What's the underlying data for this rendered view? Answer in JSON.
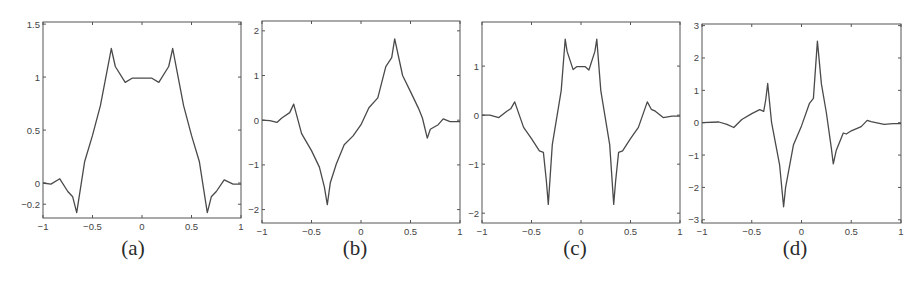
{
  "figure": {
    "line_color": "#4a4a4a",
    "axis_color": "#555555"
  },
  "chart_data": [
    {
      "type": "line",
      "caption": "(a)",
      "xlabel": "",
      "ylabel": "",
      "xlim": [
        -1,
        1
      ],
      "ylim": [
        -0.33,
        1.52
      ],
      "xticks": [
        -1,
        -0.5,
        0,
        0.5,
        1
      ],
      "xtick_labels": [
        "-1",
        "-0.5",
        "0",
        "0.5",
        "1"
      ],
      "yticks": [
        -0.2,
        0,
        0.5,
        1,
        1.5
      ],
      "ytick_labels": [
        "-0.2",
        "0",
        "0.5",
        "1",
        "1.5"
      ],
      "grid": false,
      "box": {
        "left": 43,
        "right": 241,
        "top": 22,
        "bottom": 218
      },
      "caption_pos": {
        "x": 133,
        "y": 236
      },
      "x": [
        -1,
        -0.92,
        -0.83,
        -0.75,
        -0.7,
        -0.66,
        -0.58,
        -0.5,
        -0.42,
        -0.34,
        -0.31,
        -0.27,
        -0.17,
        -0.1,
        0,
        0.1,
        0.17,
        0.27,
        0.31,
        0.34,
        0.42,
        0.5,
        0.58,
        0.66,
        0.7,
        0.75,
        0.83,
        0.92,
        1
      ],
      "y": [
        0,
        -0.01,
        0.04,
        -0.08,
        -0.13,
        -0.28,
        0.2,
        0.45,
        0.73,
        1.12,
        1.27,
        1.1,
        0.95,
        0.99,
        0.99,
        0.99,
        0.95,
        1.1,
        1.27,
        1.12,
        0.73,
        0.45,
        0.2,
        -0.28,
        -0.13,
        -0.08,
        0.03,
        -0.01,
        -0.01
      ]
    },
    {
      "type": "line",
      "caption": "(b)",
      "xlabel": "",
      "ylabel": "",
      "xlim": [
        -1,
        1
      ],
      "ylim": [
        -2.3,
        2.22
      ],
      "xticks": [
        -1,
        -0.5,
        0,
        0.5,
        1
      ],
      "xtick_labels": [
        "-1",
        "-0.5",
        "0",
        "0.5",
        "1"
      ],
      "yticks": [
        -2,
        -1,
        0,
        1,
        2
      ],
      "ytick_labels": [
        "-2",
        "-1",
        "0",
        "1",
        "2"
      ],
      "grid": false,
      "box": {
        "left": 262,
        "right": 460,
        "top": 21,
        "bottom": 223
      },
      "caption_pos": {
        "x": 355,
        "y": 236
      },
      "x": [
        -1,
        -0.92,
        -0.85,
        -0.8,
        -0.72,
        -0.68,
        -0.6,
        -0.5,
        -0.42,
        -0.37,
        -0.34,
        -0.31,
        -0.25,
        -0.17,
        -0.08,
        0,
        0.08,
        0.17,
        0.25,
        0.31,
        0.34,
        0.42,
        0.5,
        0.58,
        0.62,
        0.67,
        0.7,
        0.78,
        0.83,
        0.9,
        1
      ],
      "y": [
        0,
        -0.01,
        -0.05,
        0.05,
        0.17,
        0.36,
        -0.3,
        -0.68,
        -1.05,
        -1.5,
        -1.89,
        -1.4,
        -0.98,
        -0.55,
        -0.35,
        -0.1,
        0.28,
        0.5,
        1.2,
        1.4,
        1.82,
        1.0,
        0.64,
        0.27,
        0.05,
        -0.4,
        -0.2,
        -0.1,
        0.03,
        -0.03,
        -0.03
      ]
    },
    {
      "type": "line",
      "caption": "(c)",
      "xlabel": "",
      "ylabel": "",
      "xlim": [
        -1,
        1
      ],
      "ylim": [
        -2.2,
        1.9
      ],
      "xticks": [
        -1,
        -0.5,
        0,
        0.5,
        1
      ],
      "xtick_labels": [
        "-1",
        "-0.5",
        "0",
        "0.5",
        "1"
      ],
      "yticks": [
        -2,
        -1,
        0,
        1
      ],
      "ytick_labels": [
        "-2",
        "-1",
        "0",
        "1"
      ],
      "grid": false,
      "box": {
        "left": 482,
        "right": 680,
        "top": 22,
        "bottom": 223
      },
      "caption_pos": {
        "x": 575,
        "y": 236
      },
      "x": [
        -1,
        -0.92,
        -0.83,
        -0.75,
        -0.71,
        -0.67,
        -0.58,
        -0.5,
        -0.42,
        -0.38,
        -0.35,
        -0.33,
        -0.29,
        -0.2,
        -0.16,
        -0.14,
        -0.08,
        -0.04,
        0,
        0.04,
        0.08,
        0.14,
        0.16,
        0.2,
        0.29,
        0.33,
        0.35,
        0.38,
        0.42,
        0.5,
        0.58,
        0.67,
        0.71,
        0.75,
        0.83,
        0.92,
        1
      ],
      "y": [
        0,
        0,
        -0.05,
        0.08,
        0.13,
        0.27,
        -0.25,
        -0.48,
        -0.73,
        -0.76,
        -1.35,
        -1.82,
        -0.6,
        0.5,
        1.55,
        1.3,
        0.93,
        0.99,
        0.99,
        0.99,
        0.92,
        1.3,
        1.55,
        0.5,
        -0.6,
        -1.82,
        -1.35,
        -0.76,
        -0.73,
        -0.48,
        -0.25,
        0.27,
        0.12,
        0.08,
        -0.05,
        -0.02,
        -0.02
      ]
    },
    {
      "type": "line",
      "caption": "(d)",
      "xlabel": "",
      "ylabel": "",
      "xlim": [
        -1,
        1
      ],
      "ylim": [
        -3.1,
        3.05
      ],
      "xticks": [
        -1,
        -0.5,
        0,
        0.5,
        1
      ],
      "xtick_labels": [
        "-1",
        "-0.5",
        "0",
        "0.5",
        "1"
      ],
      "yticks": [
        -3,
        -2,
        -1,
        0,
        1,
        2,
        3
      ],
      "ytick_labels": [
        "-3",
        "-2",
        "-1",
        "0",
        "1",
        "2",
        "3"
      ],
      "grid": false,
      "box": {
        "left": 702,
        "right": 901,
        "top": 24,
        "bottom": 223
      },
      "caption_pos": {
        "x": 795,
        "y": 236
      },
      "x": [
        -1,
        -0.83,
        -0.75,
        -0.68,
        -0.6,
        -0.5,
        -0.42,
        -0.38,
        -0.36,
        -0.34,
        -0.3,
        -0.22,
        -0.18,
        -0.16,
        -0.08,
        0,
        0.08,
        0.12,
        0.16,
        0.2,
        0.25,
        0.3,
        0.32,
        0.35,
        0.42,
        0.45,
        0.5,
        0.6,
        0.66,
        0.7,
        0.83,
        0.92,
        1
      ],
      "y": [
        0,
        0.02,
        -0.05,
        -0.15,
        0.1,
        0.28,
        0.4,
        0.35,
        0.7,
        1.21,
        0.0,
        -1.3,
        -2.6,
        -2.0,
        -0.68,
        -0.1,
        0.6,
        0.75,
        2.52,
        1.2,
        0.3,
        -0.8,
        -1.27,
        -0.85,
        -0.32,
        -0.35,
        -0.25,
        -0.12,
        0.07,
        0.03,
        -0.05,
        -0.03,
        -0.03
      ]
    }
  ]
}
